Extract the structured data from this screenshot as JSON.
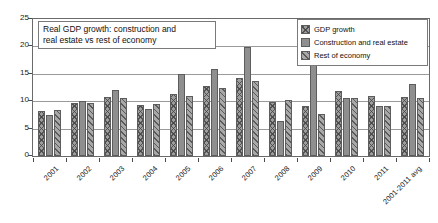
{
  "chart_data": {
    "type": "bar",
    "title": "Real GDP growth: construction and real estate vs rest of economy",
    "title_lines": [
      "Real GDP growth: construction and",
      "real estate vs rest of economy"
    ],
    "xlabel": "",
    "ylabel": "",
    "ylim": [
      0,
      25
    ],
    "yticks": [
      0,
      5,
      10,
      15,
      20,
      25
    ],
    "ytick_labels": [
      "0",
      "5",
      "10",
      "15",
      "20",
      "25"
    ],
    "grid": true,
    "grid_axis": "y",
    "legend_position": "top-right",
    "categories": [
      "2001",
      "2002",
      "2003",
      "2004",
      "2005",
      "2006",
      "2007",
      "2008",
      "2009",
      "2010",
      "2011",
      "2001-2011 avg"
    ],
    "series": [
      {
        "name": "GDP growth",
        "pattern": "cross-hatch",
        "color": "#9d9d9d",
        "values": [
          8.2,
          9.7,
          10.7,
          9.4,
          11.4,
          12.7,
          14.2,
          9.8,
          9.2,
          11.9,
          10.9,
          10.8
        ]
      },
      {
        "name": "Construction and real estate",
        "pattern": "solid",
        "color": "#8f8f8f",
        "values": [
          7.5,
          10.1,
          12.0,
          8.6,
          15.0,
          15.8,
          19.9,
          6.4,
          23.4,
          10.5,
          9.2,
          13.2
        ]
      },
      {
        "name": "Rest of economy",
        "pattern": "diagonal-hatch",
        "color": "#a8a8a8",
        "values": [
          8.4,
          9.6,
          10.6,
          9.5,
          11.0,
          12.4,
          13.6,
          10.2,
          7.6,
          10.6,
          9.2,
          10.5
        ]
      }
    ]
  },
  "legend": {
    "items": [
      {
        "label": "GDP growth"
      },
      {
        "label": "Construction and real estate"
      },
      {
        "label": "Rest of economy"
      }
    ]
  }
}
